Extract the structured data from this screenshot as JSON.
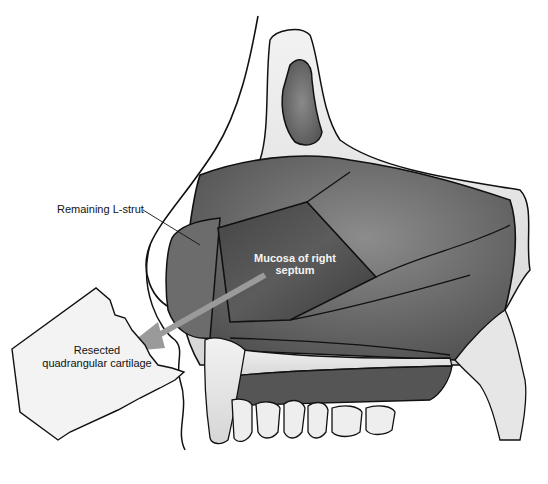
{
  "figure": {
    "labels": {
      "l_strut": "Remaining L-strut",
      "mucosa": "Mucosa of right septum",
      "resected": "Resected quadrangular cartilage"
    },
    "colors": {
      "background": "#ffffff",
      "tissue_dark": "#5a5a5a",
      "tissue_mid": "#767676",
      "bone_light": "#e8e8e8",
      "outline": "#111111",
      "arrow": "#9a9a9a",
      "cartilage_piece": "#f2f2f2"
    }
  }
}
